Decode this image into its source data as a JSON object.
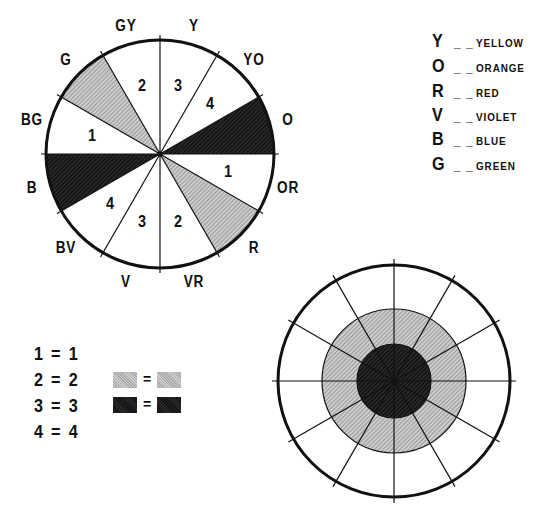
{
  "wheel": {
    "center": [
      160,
      154
    ],
    "radius": 114,
    "segments": [
      {
        "label": "O",
        "start": 0,
        "end": 30,
        "fill": "dark",
        "number": ""
      },
      {
        "label": "YO",
        "start": 30,
        "end": 60,
        "fill": "white",
        "number": "4"
      },
      {
        "label": "Y",
        "start": 60,
        "end": 90,
        "fill": "white",
        "number": "3"
      },
      {
        "label": "GY",
        "start": 90,
        "end": 120,
        "fill": "white",
        "number": "2"
      },
      {
        "label": "G",
        "start": 120,
        "end": 150,
        "fill": "gray",
        "number": ""
      },
      {
        "label": "BG",
        "start": 150,
        "end": 180,
        "fill": "white",
        "number": "1"
      },
      {
        "label": "B",
        "start": 180,
        "end": 210,
        "fill": "dark",
        "number": ""
      },
      {
        "label": "BV",
        "start": 210,
        "end": 240,
        "fill": "white",
        "number": "4"
      },
      {
        "label": "V",
        "start": 240,
        "end": 270,
        "fill": "white",
        "number": "3"
      },
      {
        "label": "VR",
        "start": 270,
        "end": 300,
        "fill": "white",
        "number": "2"
      },
      {
        "label": "R",
        "start": 300,
        "end": 330,
        "fill": "gray",
        "number": ""
      },
      {
        "label": "OR",
        "start": 330,
        "end": 360,
        "fill": "white",
        "number": "1"
      }
    ]
  },
  "legend": [
    {
      "letter": "Y",
      "dash": "_ _",
      "name": "YELLOW"
    },
    {
      "letter": "O",
      "dash": "_ _",
      "name": "ORANGE"
    },
    {
      "letter": "R",
      "dash": "_ _",
      "name": "RED"
    },
    {
      "letter": "V",
      "dash": "_ _",
      "name": "VIOLET"
    },
    {
      "letter": "B",
      "dash": "_ _",
      "name": "BLUE"
    },
    {
      "letter": "G",
      "dash": "_ _",
      "name": "GREEN"
    }
  ],
  "equivalences": {
    "numbers": [
      "1 = 1",
      "2 = 2",
      "3 = 3",
      "4 = 4"
    ],
    "swatches": [
      {
        "left": "gray",
        "sign": "=",
        "right": "gray"
      },
      {
        "left": "dark",
        "sign": "=",
        "right": "dark"
      }
    ]
  },
  "target_wheel": {
    "center": [
      394,
      381
    ],
    "outer_radius": 116,
    "middle_radius": 72,
    "inner_radius": 37,
    "spokes": 12
  },
  "colors": {
    "gray": "#bdbdbd",
    "dark": "#1a1a1a",
    "line": "#111111"
  }
}
